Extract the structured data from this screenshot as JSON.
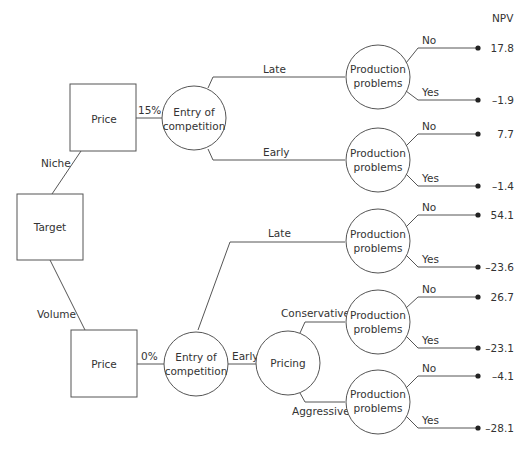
{
  "header": {
    "npv_label": "NPV"
  },
  "nodes": {
    "target": "Target",
    "price_top": "Price",
    "price_bottom": "Price",
    "entry_top": [
      "Entry of",
      "competition"
    ],
    "entry_bottom": [
      "Entry of",
      "competition"
    ],
    "pricing": "Pricing",
    "production": [
      "Production",
      "problems"
    ]
  },
  "branches": {
    "niche": "Niche",
    "volume": "Volume",
    "pct_top": "15%",
    "pct_bottom": "0%",
    "late": "Late",
    "early": "Early",
    "conservative": "Conservative",
    "aggressive": "Aggressive",
    "no": "No",
    "yes": "Yes"
  },
  "outcomes": [
    "17.8",
    "–1.9",
    "7.7",
    "–1.4",
    "54.1",
    "–23.6",
    "26.7",
    "–23.1",
    "–4.1",
    "–28.1"
  ]
}
